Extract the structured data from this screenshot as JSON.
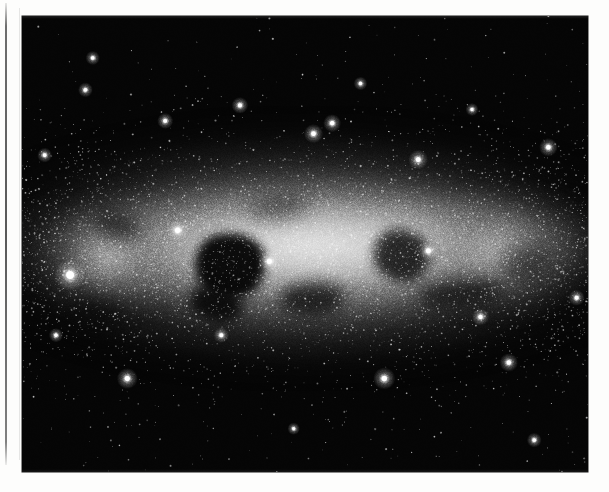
{
  "page": {
    "background_color": "#fdfdfc",
    "margin_rule": {
      "name": "vertical-rule",
      "color": "#3c3c3c",
      "x": 5,
      "top": 3,
      "height": 462,
      "width": 1.5
    }
  },
  "figure": {
    "kind": "astrophotograph",
    "caption": "",
    "plate": {
      "x": 22,
      "y": 16,
      "width": 566,
      "height": 456,
      "background_color": "#050505",
      "border_color": "#000000"
    },
    "palette": {
      "sky": "#050505",
      "band_bright": "#e8e8e8",
      "band_mid": "#9a9a9a",
      "band_faint": "#3c3c3c",
      "star": "#ffffff",
      "dust": "#060606"
    },
    "galactic_band": {
      "orientation": "horizontal",
      "center_y_fraction": 0.52,
      "peak_brightness": 0.95,
      "half_height_fraction": 0.22
    },
    "dust_lanes": [
      {
        "name": "central-dark-nebula",
        "x": 0.305,
        "y": 0.475,
        "w": 0.125,
        "h": 0.145,
        "rot": -8,
        "blur": 5,
        "opacity": 0.97
      },
      {
        "name": "central-dark-nebula-tail",
        "x": 0.295,
        "y": 0.595,
        "w": 0.095,
        "h": 0.075,
        "rot": 12,
        "blur": 6,
        "opacity": 0.9
      },
      {
        "name": "mid-dark-patch",
        "x": 0.455,
        "y": 0.585,
        "w": 0.115,
        "h": 0.07,
        "rot": -4,
        "blur": 7,
        "opacity": 0.72
      },
      {
        "name": "right-dark-nebula",
        "x": 0.62,
        "y": 0.47,
        "w": 0.1,
        "h": 0.115,
        "rot": 10,
        "blur": 6,
        "opacity": 0.82
      },
      {
        "name": "right-dark-streak",
        "x": 0.7,
        "y": 0.58,
        "w": 0.15,
        "h": 0.06,
        "rot": -6,
        "blur": 8,
        "opacity": 0.66
      },
      {
        "name": "left-dark-wisp",
        "x": 0.125,
        "y": 0.43,
        "w": 0.085,
        "h": 0.06,
        "rot": 14,
        "blur": 8,
        "opacity": 0.55
      },
      {
        "name": "upper-dark-wisp",
        "x": 0.4,
        "y": 0.395,
        "w": 0.11,
        "h": 0.05,
        "rot": -10,
        "blur": 9,
        "opacity": 0.45
      },
      {
        "name": "lower-left-dark-wisp",
        "x": 0.075,
        "y": 0.62,
        "w": 0.11,
        "h": 0.065,
        "rot": 6,
        "blur": 9,
        "opacity": 0.58
      },
      {
        "name": "far-right-dark-wisp",
        "x": 0.845,
        "y": 0.505,
        "w": 0.09,
        "h": 0.08,
        "rot": -12,
        "blur": 9,
        "opacity": 0.5
      }
    ],
    "bright_stars": [
      {
        "x": 0.085,
        "y": 0.568,
        "r": 5.2,
        "name": "bright-star-left"
      },
      {
        "x": 0.275,
        "y": 0.47,
        "r": 3.6,
        "name": "bright-star-mid-left"
      },
      {
        "x": 0.437,
        "y": 0.538,
        "r": 3.4,
        "name": "bright-star-center"
      },
      {
        "x": 0.718,
        "y": 0.515,
        "r": 3.3,
        "name": "bright-star-right"
      },
      {
        "x": 0.7,
        "y": 0.315,
        "r": 3.2,
        "name": "bright-star-upper-right"
      },
      {
        "x": 0.515,
        "y": 0.258,
        "r": 3.1,
        "name": "bright-star-upper-center"
      },
      {
        "x": 0.93,
        "y": 0.288,
        "r": 3.0,
        "name": "bright-star-upper-far-right"
      },
      {
        "x": 0.548,
        "y": 0.235,
        "r": 2.9,
        "name": "bright-star-upper-mid"
      },
      {
        "x": 0.385,
        "y": 0.196,
        "r": 2.7,
        "name": "bright-star-high-center"
      },
      {
        "x": 0.253,
        "y": 0.23,
        "r": 2.6,
        "name": "bright-star-high-left"
      },
      {
        "x": 0.112,
        "y": 0.162,
        "r": 2.4,
        "name": "bright-star-top-left"
      },
      {
        "x": 0.125,
        "y": 0.092,
        "r": 2.3,
        "name": "bright-star-top-left-2"
      },
      {
        "x": 0.186,
        "y": 0.795,
        "r": 3.4,
        "name": "bright-star-lower-left"
      },
      {
        "x": 0.64,
        "y": 0.795,
        "r": 3.6,
        "name": "bright-star-lower-right"
      },
      {
        "x": 0.86,
        "y": 0.76,
        "r": 3.0,
        "name": "bright-star-lower-far-right"
      },
      {
        "x": 0.81,
        "y": 0.66,
        "r": 2.8,
        "name": "bright-star-low-right"
      },
      {
        "x": 0.352,
        "y": 0.7,
        "r": 2.5,
        "name": "bright-star-low-center"
      },
      {
        "x": 0.06,
        "y": 0.7,
        "r": 2.3,
        "name": "bright-star-low-left"
      },
      {
        "x": 0.98,
        "y": 0.618,
        "r": 2.6,
        "name": "bright-star-edge-right"
      },
      {
        "x": 0.905,
        "y": 0.93,
        "r": 2.4,
        "name": "bright-star-bottom-right"
      },
      {
        "x": 0.48,
        "y": 0.905,
        "r": 2.0,
        "name": "bright-star-bottom-center"
      },
      {
        "x": 0.598,
        "y": 0.148,
        "r": 2.2,
        "name": "bright-star-top-center"
      },
      {
        "x": 0.795,
        "y": 0.205,
        "r": 2.1,
        "name": "bright-star-top-right"
      },
      {
        "x": 0.04,
        "y": 0.305,
        "r": 2.4,
        "name": "bright-star-left-edge"
      }
    ],
    "star_counts": {
      "field_stars": 2600,
      "band_stars": 5200
    },
    "grain": {
      "opacity": 0.5,
      "density": 0.34
    }
  }
}
